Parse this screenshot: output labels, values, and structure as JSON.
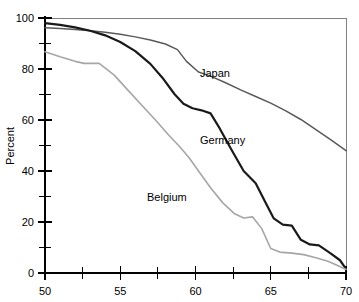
{
  "chart_data": {
    "type": "line",
    "title": "",
    "xlabel": "",
    "ylabel": "Percent",
    "xlim": [
      50,
      70
    ],
    "ylim": [
      0,
      100
    ],
    "grid": false,
    "legend_position": "inline-annotations",
    "xticks": [
      50,
      55,
      60,
      65,
      70
    ],
    "xticks_minor": [
      52.5,
      57.5,
      62.5,
      67.5
    ],
    "yticks": [
      0,
      20,
      40,
      60,
      80,
      100
    ],
    "yticks_minor": [
      10,
      30,
      50,
      70,
      90
    ],
    "series": [
      {
        "name": "Japan",
        "color": "#595959",
        "width": 1.5,
        "x": [
          50,
          51,
          52,
          53,
          54,
          55,
          56,
          57,
          58,
          58.8,
          59.4,
          60.2,
          61,
          62,
          63,
          64,
          65,
          66,
          67,
          68,
          69,
          70
        ],
        "values": [
          96.2,
          95.9,
          95.5,
          95.0,
          94.4,
          93.6,
          92.6,
          91.4,
          89.8,
          87.6,
          83.0,
          78.8,
          77.2,
          74.6,
          71.8,
          69.2,
          66.6,
          63.6,
          60.2,
          56.2,
          52.2,
          48.0
        ]
      },
      {
        "name": "Germany",
        "color": "#1a1a1a",
        "width": 2.2,
        "x": [
          50,
          51,
          52,
          53,
          54,
          55,
          56,
          57,
          57.8,
          58.6,
          59.2,
          59.8,
          60.4,
          61,
          61.6,
          62.4,
          63.2,
          64,
          64.6,
          65.2,
          65.8,
          66.4,
          67,
          67.6,
          68.2,
          69,
          69.6,
          70
        ],
        "values": [
          98.0,
          97.3,
          96.3,
          95.0,
          93.2,
          90.6,
          87.0,
          82.0,
          76.6,
          70.2,
          66.4,
          64.6,
          63.8,
          62.6,
          56.8,
          48.2,
          40.0,
          35.2,
          28.2,
          21.4,
          19.0,
          18.6,
          13.0,
          11.2,
          10.8,
          7.6,
          5.0,
          1.6
        ]
      },
      {
        "name": "Belgium",
        "color": "#a6a6a6",
        "width": 1.6,
        "x": [
          50,
          51,
          52,
          52.6,
          53.6,
          54.6,
          55.4,
          56.4,
          57.4,
          58.2,
          59,
          59.6,
          60.2,
          61,
          61.8,
          62.6,
          63.2,
          63.8,
          64.4,
          65,
          65.6,
          66.4,
          67.2,
          68,
          68.8,
          69.4,
          70
        ],
        "values": [
          86.8,
          84.8,
          83.0,
          82.2,
          82.2,
          77.6,
          72.4,
          66.0,
          59.6,
          54.2,
          49.2,
          45.0,
          40.0,
          33.4,
          27.6,
          23.2,
          21.6,
          22.0,
          17.4,
          9.6,
          8.2,
          7.8,
          7.2,
          6.0,
          4.6,
          3.0,
          1.4
        ]
      }
    ],
    "annotations": [
      {
        "text": "Japan",
        "x_px": 200,
        "y_px": 77
      },
      {
        "text": "Germany",
        "x_px": 200,
        "y_px": 144
      },
      {
        "text": "Belgium",
        "x_px": 147,
        "y_px": 201
      }
    ]
  },
  "axis": {
    "y_title": "Percent",
    "x_tick_labels": [
      "50",
      "55",
      "60",
      "65",
      "70"
    ],
    "y_tick_labels": [
      "0",
      "20",
      "40",
      "60",
      "80",
      "100"
    ]
  }
}
